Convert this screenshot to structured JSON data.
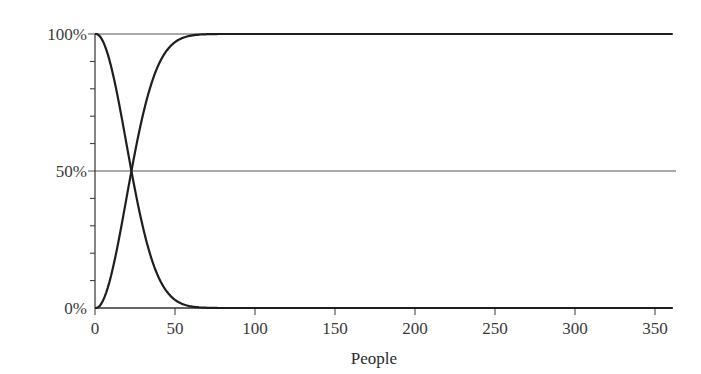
{
  "chart_data": {
    "type": "line",
    "title": "",
    "xlabel": "People",
    "ylabel": "",
    "xlim": [
      0,
      362
    ],
    "ylim": [
      0,
      100
    ],
    "x_ticks": [
      0,
      50,
      100,
      150,
      200,
      250,
      300,
      350
    ],
    "x_tick_labels": [
      "0",
      "50",
      "100",
      "150",
      "200",
      "250",
      "300",
      "350"
    ],
    "y_ticks": [
      0,
      50,
      100
    ],
    "y_tick_labels": [
      "0%",
      "50%",
      "100%"
    ],
    "y_minor_ticks": [
      10,
      20,
      30,
      40,
      60,
      70,
      80,
      90
    ],
    "reference_lines": [
      0,
      50,
      100
    ],
    "grid": false,
    "legend": null,
    "series": [
      {
        "name": "Probability of no shared birthday",
        "x": [
          0,
          5,
          10,
          15,
          20,
          23,
          25,
          30,
          35,
          40,
          45,
          50,
          55,
          60,
          70,
          100,
          200,
          362
        ],
        "values": [
          100,
          97.3,
          88.3,
          74.7,
          58.9,
          49.3,
          43.1,
          29.4,
          18.6,
          10.9,
          5.9,
          3.0,
          1.4,
          0.6,
          0.1,
          0,
          0,
          0
        ]
      },
      {
        "name": "Probability of shared birthday",
        "x": [
          0,
          5,
          10,
          15,
          20,
          23,
          25,
          30,
          35,
          40,
          45,
          50,
          55,
          60,
          70,
          100,
          200,
          362
        ],
        "values": [
          0,
          2.7,
          11.7,
          25.3,
          41.1,
          50.7,
          56.9,
          70.6,
          81.4,
          89.1,
          94.1,
          97.0,
          98.6,
          99.4,
          99.9,
          100,
          100,
          100
        ]
      }
    ],
    "annotations": [
      "Curves cross at 50% near 23 people"
    ]
  },
  "axes": {
    "x_title": "People",
    "y_labels": {
      "top": "100%",
      "mid": "50%",
      "bottom": "0%"
    },
    "x_labels": [
      "0",
      "50",
      "100",
      "150",
      "200",
      "250",
      "300",
      "350"
    ]
  },
  "colors": {
    "curve": "#1e1e1e",
    "axis": "#333333",
    "reference": "#555555",
    "text": "#3a3a3a"
  }
}
